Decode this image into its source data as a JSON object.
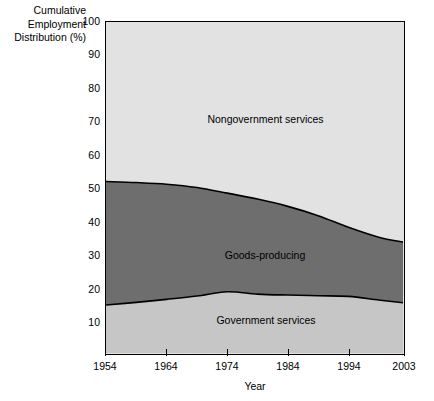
{
  "axes": {
    "y_title_lines": [
      "Cumulative",
      "Employment",
      "Distribution (%)"
    ],
    "x_title": "Year",
    "y_ticks": [
      "100",
      "90",
      "80",
      "70",
      "60",
      "50",
      "40",
      "30",
      "20",
      "10"
    ],
    "x_ticks": [
      "1954",
      "1964",
      "1974",
      "1984",
      "1994",
      "2003"
    ]
  },
  "labels": {
    "nongovernment": "Nongovernment services",
    "goods": "Goods-producing",
    "government": "Government services"
  },
  "colors": {
    "nongovernment": "#e2e2e2",
    "goods": "#6e6e6e",
    "government": "#c6c6c6",
    "axis": "#000000",
    "page": "#ffffff"
  },
  "chart_data": {
    "type": "area",
    "title": "",
    "subtitle": "",
    "xlabel": "Year",
    "ylabel": "Cumulative Employment Distribution (%)",
    "xlim": [
      1954,
      2003
    ],
    "ylim": [
      0,
      100
    ],
    "yticks": [
      10,
      20,
      30,
      40,
      50,
      60,
      70,
      80,
      90,
      100
    ],
    "xticks": [
      1954,
      1964,
      1974,
      1984,
      1994,
      2003
    ],
    "grid": false,
    "legend": "in-plot labels",
    "stacked": true,
    "x": [
      1954,
      1959,
      1964,
      1969,
      1974,
      1979,
      1984,
      1989,
      1994,
      1999,
      2003
    ],
    "boundaries": {
      "government_top": [
        14.5,
        15.3,
        16.2,
        17.2,
        18.5,
        17.8,
        17.5,
        17.3,
        17.1,
        16.0,
        15.2
      ],
      "goods_top": [
        51.8,
        51.5,
        51.0,
        50.0,
        48.3,
        46.5,
        44.3,
        41.5,
        38.0,
        35.0,
        33.5
      ]
    },
    "series": [
      {
        "name": "Government services",
        "values": [
          14.5,
          15.3,
          16.2,
          17.2,
          18.5,
          17.8,
          17.5,
          17.3,
          17.1,
          16.0,
          15.2
        ]
      },
      {
        "name": "Goods-producing",
        "values": [
          37.3,
          36.2,
          34.8,
          32.8,
          29.8,
          28.7,
          26.8,
          24.2,
          20.9,
          19.0,
          18.3
        ]
      },
      {
        "name": "Nongovernment services",
        "values": [
          48.2,
          48.5,
          49.0,
          50.0,
          51.7,
          53.5,
          55.7,
          58.5,
          62.0,
          65.0,
          66.5
        ]
      }
    ]
  }
}
